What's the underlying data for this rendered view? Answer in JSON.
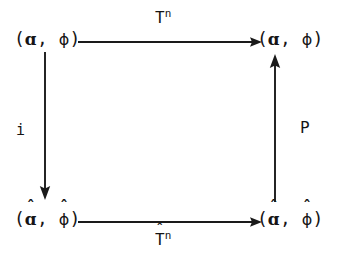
{
  "diagram": {
    "kind": "commutative-diagram",
    "shape": "square",
    "ink_color": "#1a1a1a",
    "background_color": "#ffffff",
    "nodes": [
      {
        "id": "top-left",
        "position": "top-left",
        "text": "(ɑ, ϕ)",
        "open_paren": "(",
        "object_symbol": "ɑ",
        "comma": ",",
        "map_symbol": "ϕ",
        "close_paren": ")",
        "object_hat": "",
        "map_hat": ""
      },
      {
        "id": "top-right",
        "position": "top-right",
        "text": "(ɑ, ϕ)",
        "open_paren": "(",
        "object_symbol": "ɑ",
        "comma": ",",
        "map_symbol": "ϕ",
        "close_paren": ")",
        "object_hat": "",
        "map_hat": ""
      },
      {
        "id": "bottom-left",
        "position": "bottom-left",
        "text": "(ɑ̂, ϕ̂)",
        "open_paren": "(",
        "object_symbol": "ɑ",
        "comma": ",",
        "map_symbol": "ϕ",
        "close_paren": ")",
        "object_hat": "ˆ",
        "map_hat": "ˆ"
      },
      {
        "id": "bottom-right",
        "position": "bottom-right",
        "text": "(ɑ̂, ϕ̂)",
        "open_paren": "(",
        "object_symbol": "ɑ",
        "comma": ",",
        "map_symbol": "ϕ",
        "close_paren": ")",
        "object_hat": "ˆ",
        "map_hat": "ˆ"
      }
    ],
    "arrows": [
      {
        "id": "top-arrow",
        "from": "top-left",
        "to": "top-right",
        "orientation": "horizontal",
        "direction": "right",
        "label_base": "T",
        "label_exponent": "n",
        "label_hat": "",
        "label_text": "Tⁿ"
      },
      {
        "id": "bottom-arrow",
        "from": "bottom-left",
        "to": "bottom-right",
        "orientation": "horizontal",
        "direction": "right",
        "label_base": "T",
        "label_exponent": "n",
        "label_hat": "ˆ",
        "label_text": "T̂ⁿ"
      },
      {
        "id": "left-arrow",
        "from": "top-left",
        "to": "bottom-left",
        "orientation": "vertical",
        "direction": "down",
        "label_base": "i",
        "label_exponent": "",
        "label_hat": "",
        "label_text": "i"
      },
      {
        "id": "right-arrow",
        "from": "bottom-right",
        "to": "top-right",
        "orientation": "vertical",
        "direction": "up",
        "label_base": "P",
        "label_exponent": "",
        "label_hat": "",
        "label_text": "P"
      }
    ]
  }
}
